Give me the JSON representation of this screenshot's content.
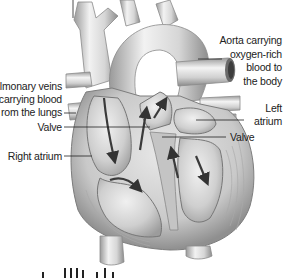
{
  "diagram": {
    "labels": {
      "pulmonary_veins": [
        "lmonary veins",
        "carrying blood",
        "rom the lungs"
      ],
      "valve_left": "Valve",
      "right_atrium": "Right atrium",
      "aorta": [
        "Aorta carrying",
        "oxygen-rich",
        "blood to",
        "the body"
      ],
      "left_atrium": [
        "Left",
        "atrium"
      ],
      "valve_right": "Valve"
    },
    "caption_cut": "...",
    "colors": {
      "background": "#ffffff",
      "tissue_light": "#e6e6e6",
      "tissue_mid": "#bdbdbd",
      "tissue_dark": "#7a7a7a",
      "arrow": "#3a3a3a",
      "leader_line": "#222222",
      "text": "#222222"
    }
  }
}
